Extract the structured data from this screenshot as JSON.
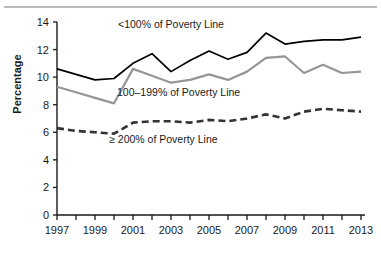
{
  "chart_data": {
    "type": "line",
    "title": "",
    "xlabel": "",
    "ylabel": "Percentage",
    "xlim": [
      1997,
      2013
    ],
    "ylim": [
      0,
      14
    ],
    "yticks": [
      0,
      2,
      4,
      6,
      8,
      10,
      12,
      14
    ],
    "xticks": [
      1997,
      1998,
      1999,
      2000,
      2001,
      2002,
      2003,
      2004,
      2005,
      2006,
      2007,
      2008,
      2009,
      2010,
      2011,
      2012,
      2013
    ],
    "xtick_labels_shown": [
      "1997",
      "1999",
      "2001",
      "2003",
      "2005",
      "2007",
      "2009",
      "2011",
      "2013"
    ],
    "grid": false,
    "legend_position": "inline-annotations",
    "x": [
      1997,
      1998,
      1999,
      2000,
      2001,
      2002,
      2003,
      2004,
      2005,
      2006,
      2007,
      2008,
      2009,
      2010,
      2011,
      2012,
      2013
    ],
    "series": [
      {
        "name": "<100% of Poverty Line",
        "color": "#000000",
        "style": "solid",
        "values": [
          10.6,
          10.2,
          9.8,
          9.9,
          11.0,
          11.7,
          10.4,
          11.2,
          11.9,
          11.3,
          11.8,
          13.2,
          12.4,
          12.6,
          12.7,
          12.7,
          12.9
        ]
      },
      {
        "name": "100–199% of Poverty Line",
        "color": "#969696",
        "style": "solid",
        "values": [
          9.3,
          8.9,
          8.5,
          8.1,
          10.6,
          10.1,
          9.6,
          9.8,
          10.2,
          9.8,
          10.4,
          11.4,
          11.5,
          10.3,
          10.9,
          10.3,
          10.4
        ]
      },
      {
        "name": "≥ 200% of Poverty Line",
        "color": "#333333",
        "style": "dashed",
        "values": [
          6.3,
          6.1,
          6.0,
          5.9,
          6.7,
          6.8,
          6.8,
          6.7,
          6.9,
          6.8,
          7.0,
          7.3,
          7.0,
          7.5,
          7.7,
          7.6,
          7.5
        ]
      }
    ],
    "annotations": [
      {
        "text": "<100% of Poverty Line",
        "x": 2003,
        "y": 13.6
      },
      {
        "text": "100–199% of Poverty Line",
        "x": 2003.4,
        "y": 8.6
      },
      {
        "text": "≥ 200% of Poverty Line",
        "x": 2002.6,
        "y": 5.2
      }
    ]
  }
}
